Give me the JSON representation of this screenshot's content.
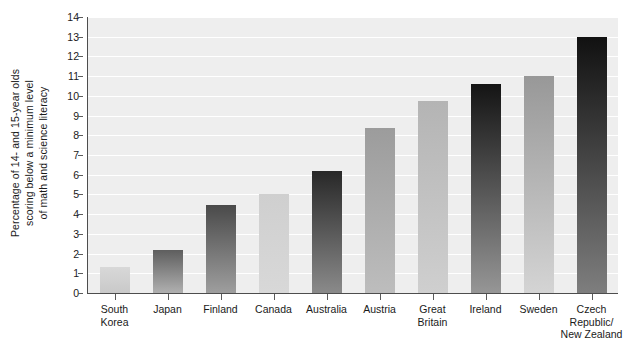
{
  "chart_data": {
    "type": "bar",
    "title": "",
    "xlabel": "",
    "ylabel": "Percentage of 14- and 15-year olds scoring below a minimum level of math and science literacy",
    "ylabel_lines": [
      "Percentage of 14- and 15-year olds",
      "scoring below a minimum level",
      "of math and science literacy"
    ],
    "categories": [
      "South Korea",
      "Japan",
      "Finland",
      "Canada",
      "Australia",
      "Austria",
      "Great Britain",
      "Ireland",
      "Sweden",
      "Czech Republic/New Zealand"
    ],
    "category_label_lines": [
      [
        "South",
        "Korea"
      ],
      [
        "Japan"
      ],
      [
        "Finland"
      ],
      [
        "Canada"
      ],
      [
        "Australia"
      ],
      [
        "Austria"
      ],
      [
        "Great",
        "Britain"
      ],
      [
        "Ireland"
      ],
      [
        "Sweden"
      ],
      [
        "Czech",
        "Republic/",
        "New Zealand"
      ]
    ],
    "values": [
      1.3,
      2.2,
      4.45,
      5.0,
      6.2,
      8.35,
      9.75,
      10.6,
      11.0,
      13.0
    ],
    "ylim": [
      0,
      14
    ],
    "ytick_labels": [
      "0",
      "1",
      "2",
      "3",
      "4",
      "5",
      "6",
      "7",
      "8",
      "9",
      "10",
      "11",
      "12",
      "13",
      "14"
    ],
    "ytick_values": [
      0,
      1,
      2,
      3,
      4,
      5,
      6,
      7,
      8,
      9,
      10,
      11,
      12,
      13,
      14
    ],
    "grid": true,
    "grid_color": "#ffffff",
    "legend": null,
    "plot_background": "#eeeeee",
    "bar_colors": [
      {
        "top": "#d8d8d8",
        "bottom": "#c9c9c9"
      },
      {
        "top": "#5e5e5e",
        "bottom": "#b0b0b0"
      },
      {
        "top": "#4a4a4a",
        "bottom": "#9e9e9e"
      },
      {
        "top": "#cfcfcf",
        "bottom": "#d8d8d8"
      },
      {
        "top": "#282828",
        "bottom": "#8a8a8a"
      },
      {
        "top": "#9c9c9c",
        "bottom": "#bdbdbd"
      },
      {
        "top": "#b4b4b4",
        "bottom": "#cfcfcf"
      },
      {
        "top": "#141414",
        "bottom": "#969696"
      },
      {
        "top": "#989898",
        "bottom": "#d4d4d4"
      },
      {
        "top": "#111111",
        "bottom": "#7e7e7e"
      }
    ]
  }
}
